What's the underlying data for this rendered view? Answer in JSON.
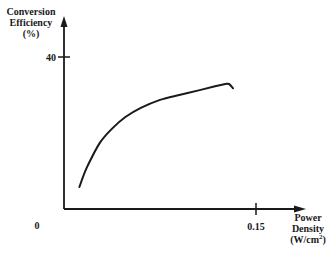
{
  "chart_data": {
    "type": "line",
    "title": "",
    "xlabel": "Power Density (W/cm²)",
    "ylabel": "Conversion Efficiency (%)",
    "xlabel_lines": [
      "Power",
      "Density",
      "(W/cm²)"
    ],
    "ylabel_lines": [
      "Conversion",
      "Efficiency",
      "(%)"
    ],
    "x_ticks": [
      "0",
      "0.15"
    ],
    "y_ticks": [
      "40"
    ],
    "xlim": [
      0,
      0.18
    ],
    "ylim": [
      0,
      45
    ],
    "grid": false,
    "legend": null,
    "series": [
      {
        "name": "Conversion Efficiency",
        "x": [
          0.012,
          0.018,
          0.028,
          0.038,
          0.048,
          0.06,
          0.075,
          0.09,
          0.106,
          0.118,
          0.126,
          0.129,
          0.132
        ],
        "y": [
          5.8,
          11.0,
          17.4,
          21.3,
          24.2,
          26.6,
          28.7,
          30.0,
          31.3,
          32.3,
          32.9,
          32.9,
          31.8
        ]
      }
    ]
  },
  "labels": {
    "y_axis_line1": "Conversion",
    "y_axis_line2": "Efficiency",
    "y_axis_line3": "(%)",
    "y_tick_40": "40",
    "x_tick_origin": "0",
    "x_tick_015": "0.15",
    "x_axis_line1": "Power",
    "x_axis_line2": "Density",
    "x_axis_line3_main": "(W/cm",
    "x_axis_line3_sup": "2",
    "x_axis_line3_end": ")"
  },
  "colors": {
    "ink": "#1a1a1a",
    "background": "#ffffff"
  }
}
